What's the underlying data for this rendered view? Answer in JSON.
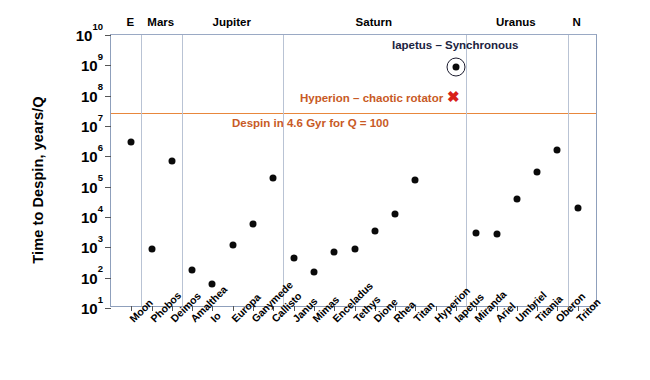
{
  "chart_data": {
    "type": "scatter",
    "title": "",
    "xlabel": "",
    "ylabel": "Time to Despin, years/Q",
    "ylim": [
      10,
      10000000000
    ],
    "ylog": true,
    "ytick_labels": [
      "10^10",
      "10^9",
      "10^8",
      "10^7",
      "10^6",
      "10^5",
      "10^4",
      "10^3",
      "10^2",
      "10^1"
    ],
    "ytick_values": [
      10000000000,
      1000000000,
      100000000,
      10000000,
      1000000,
      100000,
      10000,
      1000,
      100,
      10
    ],
    "grid": false,
    "legend": "none",
    "categories": [
      "Moon",
      "Phobos",
      "Deimos",
      "Amalthea",
      "Io",
      "Europa",
      "Ganymede",
      "Callisto",
      "Janus",
      "Mimas",
      "Enceladus",
      "Tethys",
      "Dione",
      "Rhea",
      "Titan",
      "Hyperion",
      "Iapetus",
      "Miranda",
      "Ariel",
      "Umbriel",
      "Titania",
      "Oberon",
      "Triton"
    ],
    "values": [
      3000000,
      900,
      700000,
      180,
      60,
      1200,
      6000,
      200000,
      450,
      150,
      700,
      900,
      3500,
      13000,
      170000,
      null,
      900000000,
      3000,
      2800,
      40000,
      300000,
      1600000,
      20000
    ],
    "points": [
      {
        "name": "Moon",
        "value": 3000000,
        "group": "E"
      },
      {
        "name": "Phobos",
        "value": 900,
        "group": "Mars"
      },
      {
        "name": "Deimos",
        "value": 700000,
        "group": "Mars"
      },
      {
        "name": "Amalthea",
        "value": 180,
        "group": "Jupiter"
      },
      {
        "name": "Io",
        "value": 60,
        "group": "Jupiter"
      },
      {
        "name": "Europa",
        "value": 1200,
        "group": "Jupiter"
      },
      {
        "name": "Ganymede",
        "value": 6000,
        "group": "Jupiter"
      },
      {
        "name": "Callisto",
        "value": 200000,
        "group": "Jupiter"
      },
      {
        "name": "Janus",
        "value": 450,
        "group": "Saturn"
      },
      {
        "name": "Mimas",
        "value": 150,
        "group": "Saturn"
      },
      {
        "name": "Enceladus",
        "value": 700,
        "group": "Saturn"
      },
      {
        "name": "Tethys",
        "value": 900,
        "group": "Saturn"
      },
      {
        "name": "Dione",
        "value": 3500,
        "group": "Saturn"
      },
      {
        "name": "Rhea",
        "value": 13000,
        "group": "Saturn"
      },
      {
        "name": "Titan",
        "value": 170000,
        "group": "Saturn"
      },
      {
        "name": "Hyperion",
        "value": null,
        "group": "Saturn",
        "note": "chaotic rotator - no point plotted"
      },
      {
        "name": "Iapetus",
        "value": 900000000,
        "group": "Saturn",
        "marker": "circled",
        "note": "Synchronous"
      },
      {
        "name": "Miranda",
        "value": 3000,
        "group": "Uranus"
      },
      {
        "name": "Ariel",
        "value": 2800,
        "group": "Uranus"
      },
      {
        "name": "Umbriel",
        "value": 40000,
        "group": "Uranus"
      },
      {
        "name": "Titania",
        "value": 300000,
        "group": "Uranus"
      },
      {
        "name": "Oberon",
        "value": 1600000,
        "group": "Uranus"
      },
      {
        "name": "Triton",
        "value": 20000,
        "group": "N"
      }
    ],
    "groups": [
      {
        "label": "E",
        "moons": [
          "Moon"
        ]
      },
      {
        "label": "Mars",
        "moons": [
          "Phobos",
          "Deimos"
        ]
      },
      {
        "label": "Jupiter",
        "moons": [
          "Amalthea",
          "Io",
          "Europa",
          "Ganymede",
          "Callisto"
        ]
      },
      {
        "label": "Saturn",
        "moons": [
          "Janus",
          "Mimas",
          "Enceladus",
          "Tethys",
          "Dione",
          "Rhea",
          "Titan",
          "Hyperion",
          "Iapetus"
        ]
      },
      {
        "label": "Uranus",
        "moons": [
          "Miranda",
          "Ariel",
          "Umbriel",
          "Titania",
          "Oberon"
        ]
      },
      {
        "label": "N",
        "moons": [
          "Triton"
        ]
      }
    ],
    "threshold_line": {
      "label": "Despin in 4.6 Gyr for Q = 100",
      "value": 27000000,
      "color": "#E8873C"
    },
    "annotations": [
      {
        "text": "Iapetus – Synchronous",
        "color": "#1b2340"
      },
      {
        "text": "Hyperion – chaotic rotator",
        "color": "#C85A26",
        "marker": "X",
        "marker_color": "#D8201A"
      },
      {
        "text": "Despin in 4.6 Gyr for Q = 100",
        "color": "#C85A26"
      }
    ]
  },
  "axis": {
    "ytitle": "Time to Despin, years/Q",
    "yticks": [
      {
        "mant": "10",
        "exp": "10"
      },
      {
        "mant": "10",
        "exp": "9"
      },
      {
        "mant": "10",
        "exp": "8"
      },
      {
        "mant": "10",
        "exp": "7"
      },
      {
        "mant": "10",
        "exp": "6"
      },
      {
        "mant": "10",
        "exp": "5"
      },
      {
        "mant": "10",
        "exp": "4"
      },
      {
        "mant": "10",
        "exp": "3"
      },
      {
        "mant": "10",
        "exp": "2"
      },
      {
        "mant": "10",
        "exp": "1"
      }
    ]
  },
  "colors": {
    "threshold": "#E8873C",
    "annotation_orange": "#C85A26",
    "annotation_dark": "#1b2340",
    "x_marker_red": "#D8201A",
    "point": "#0a0a0a",
    "frame": "#8fa0bc"
  },
  "annotation_text": {
    "iapetus": "Iapetus – Synchronous",
    "hyperion": "Hyperion – chaotic rotator",
    "hyperion_marker": "✖",
    "despin": "Despin in 4.6 Gyr for Q = 100"
  }
}
